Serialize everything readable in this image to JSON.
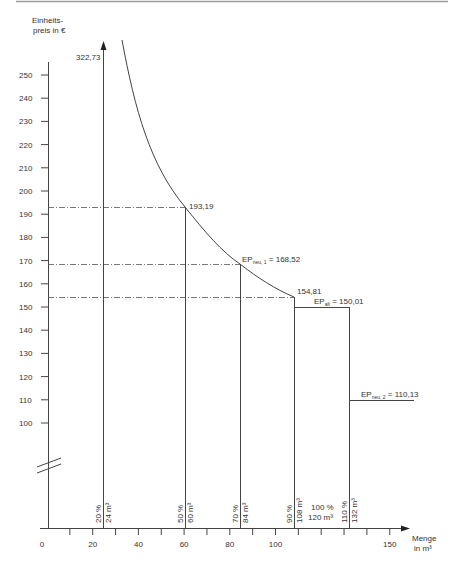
{
  "chart_data": {
    "type": "line",
    "title": "",
    "ylabel": "Einheits- preis in €",
    "ylabel_lines": [
      "Einheits-",
      "preis in €"
    ],
    "xlabel": "Menge in m³",
    "xlabel_lines": [
      "Menge",
      "in m³"
    ],
    "xlim": [
      0,
      150
    ],
    "ylim": [
      100,
      250
    ],
    "y_axis_break": true,
    "grid": false,
    "x_ticks": [
      0,
      20,
      40,
      60,
      80,
      100,
      150
    ],
    "x_minor_ticks": [
      10,
      20,
      30,
      40,
      50,
      60,
      70,
      80,
      90,
      100,
      110,
      120,
      130,
      140,
      150
    ],
    "y_ticks": [
      250,
      240,
      230,
      220,
      210,
      200,
      190,
      180,
      170,
      160,
      150,
      140,
      130,
      120,
      110,
      100
    ],
    "series": [
      {
        "name": "Einheitspreis-Kurve",
        "style": "curve",
        "points": [
          {
            "x": 24,
            "y": 322.73
          },
          {
            "x": 60,
            "y": 193.19
          },
          {
            "x": 84,
            "y": 168.52
          },
          {
            "x": 108,
            "y": 154.81
          }
        ]
      },
      {
        "name": "EP alt",
        "style": "step",
        "points": [
          {
            "x": 108,
            "y": 150.01
          },
          {
            "x": 132,
            "y": 150.01
          }
        ]
      },
      {
        "name": "EP neu 2",
        "style": "step",
        "points": [
          {
            "x": 132,
            "y": 110.13
          },
          {
            "x": 160,
            "y": 110.13
          }
        ]
      }
    ],
    "vertical_markers": [
      {
        "x": 24,
        "pct": "20 %",
        "qty": "24 m³"
      },
      {
        "x": 60,
        "pct": "50 %",
        "qty": "60 m³"
      },
      {
        "x": 84,
        "pct": "70 %",
        "qty": "84 m³"
      },
      {
        "x": 108,
        "pct": "90 %",
        "qty": "108 m³"
      },
      {
        "x": 132,
        "pct": "110 %",
        "qty": "132 m³"
      }
    ],
    "annotations": [
      {
        "text": "322,73",
        "x": 24,
        "y": 322.73
      },
      {
        "text": "193,19",
        "x": 60,
        "y": 193.19
      },
      {
        "text_main": "EP",
        "text_sub": "neu, 1",
        "text_tail": " = 168,52",
        "x": 84,
        "y": 168.52
      },
      {
        "text": "154,81",
        "x": 108,
        "y": 154.81
      },
      {
        "text_main": "EP",
        "text_sub": "alt",
        "text_tail": " = 150,01",
        "x": 120,
        "y": 150.01
      },
      {
        "text_main": "EP",
        "text_sub": "neu, 2",
        "text_tail": " = 110,13",
        "x": 140,
        "y": 110.13
      },
      {
        "text_lines": [
          "100 %",
          "120 m³"
        ],
        "x": 120
      }
    ],
    "reference_lines": [
      {
        "y": 193.19,
        "style": "dash-dot"
      },
      {
        "y": 168.52,
        "style": "dash-dot"
      },
      {
        "y": 154.81,
        "style": "dash-dot"
      }
    ]
  },
  "labels": {
    "y_title_1": "Einheits-",
    "y_title_2": "preis in €",
    "x_title_1": "Menge",
    "x_title_2": "in m³",
    "val_top": "322,73",
    "val_60": "193,19",
    "val_108": "154,81",
    "ep": "EP",
    "sub_neu1": "neu, 1",
    "tail_neu1": " = 168,52",
    "sub_alt": "alt",
    "tail_alt": " = 150,01",
    "sub_neu2": "neu, 2",
    "tail_neu2": " = 110,13",
    "mid_pct": "100 %",
    "mid_qty": "120 m³"
  }
}
